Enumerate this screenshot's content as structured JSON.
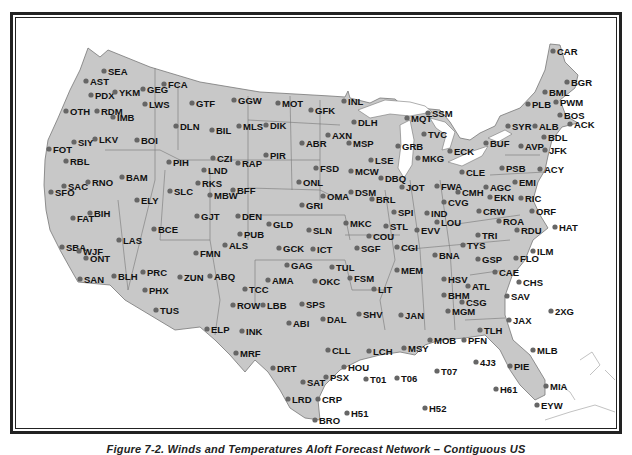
{
  "figure": {
    "caption": "Figure 7-2. Winds and Temperatures Aloft Forecast Network – Contiguous US",
    "land_color": "#c8c8c8",
    "water_color": "#ffffff",
    "dot_color": "#666666"
  },
  "stations": [
    {
      "id": "CAR",
      "x": 553,
      "y": 51
    },
    {
      "id": "BGR",
      "x": 567,
      "y": 82
    },
    {
      "id": "BML",
      "x": 545,
      "y": 92
    },
    {
      "id": "PLB",
      "x": 528,
      "y": 104
    },
    {
      "id": "PWM",
      "x": 556,
      "y": 102
    },
    {
      "id": "BOS",
      "x": 560,
      "y": 115
    },
    {
      "id": "ACK",
      "x": 570,
      "y": 124
    },
    {
      "id": "SYR",
      "x": 508,
      "y": 126
    },
    {
      "id": "ALB",
      "x": 535,
      "y": 126
    },
    {
      "id": "BDL",
      "x": 544,
      "y": 137
    },
    {
      "id": "JFK",
      "x": 545,
      "y": 150
    },
    {
      "id": "BUF",
      "x": 486,
      "y": 143
    },
    {
      "id": "AVP",
      "x": 521,
      "y": 146
    },
    {
      "id": "ACY",
      "x": 540,
      "y": 169
    },
    {
      "id": "PSB",
      "x": 502,
      "y": 168
    },
    {
      "id": "EMI",
      "x": 515,
      "y": 182
    },
    {
      "id": "SSM",
      "x": 428,
      "y": 113
    },
    {
      "id": "MQT",
      "x": 407,
      "y": 118
    },
    {
      "id": "TVC",
      "x": 424,
      "y": 134
    },
    {
      "id": "GRB",
      "x": 398,
      "y": 146
    },
    {
      "id": "MKG",
      "x": 418,
      "y": 158
    },
    {
      "id": "ECK",
      "x": 450,
      "y": 151
    },
    {
      "id": "CLE",
      "x": 462,
      "y": 172
    },
    {
      "id": "FWA",
      "x": 437,
      "y": 186
    },
    {
      "id": "CMH",
      "x": 458,
      "y": 192
    },
    {
      "id": "AGC",
      "x": 486,
      "y": 187
    },
    {
      "id": "EKN",
      "x": 490,
      "y": 197
    },
    {
      "id": "RIC",
      "x": 521,
      "y": 198
    },
    {
      "id": "ORF",
      "x": 532,
      "y": 211
    },
    {
      "id": "HAT",
      "x": 555,
      "y": 227
    },
    {
      "id": "CVG",
      "x": 444,
      "y": 202
    },
    {
      "id": "CRW",
      "x": 479,
      "y": 211
    },
    {
      "id": "ROA",
      "x": 499,
      "y": 221
    },
    {
      "id": "RDU",
      "x": 517,
      "y": 230
    },
    {
      "id": "TRI",
      "x": 478,
      "y": 235
    },
    {
      "id": "TYS",
      "x": 463,
      "y": 245
    },
    {
      "id": "ILM",
      "x": 533,
      "y": 251
    },
    {
      "id": "GSP",
      "x": 478,
      "y": 259
    },
    {
      "id": "FLO",
      "x": 516,
      "y": 258
    },
    {
      "id": "CAE",
      "x": 495,
      "y": 272
    },
    {
      "id": "CHS",
      "x": 519,
      "y": 282
    },
    {
      "id": "SAV",
      "x": 507,
      "y": 296
    },
    {
      "id": "2XG",
      "x": 551,
      "y": 311
    },
    {
      "id": "JAX",
      "x": 509,
      "y": 320
    },
    {
      "id": "TLH",
      "x": 480,
      "y": 330
    },
    {
      "id": "PFN",
      "x": 464,
      "y": 340
    },
    {
      "id": "MLB",
      "x": 533,
      "y": 350
    },
    {
      "id": "4J3",
      "x": 476,
      "y": 362
    },
    {
      "id": "PIE",
      "x": 510,
      "y": 366
    },
    {
      "id": "H61",
      "x": 496,
      "y": 389
    },
    {
      "id": "MIA",
      "x": 546,
      "y": 386
    },
    {
      "id": "EYW",
      "x": 537,
      "y": 405
    },
    {
      "id": "ATL",
      "x": 468,
      "y": 286
    },
    {
      "id": "HSV",
      "x": 444,
      "y": 279
    },
    {
      "id": "BHM",
      "x": 444,
      "y": 295
    },
    {
      "id": "CSG",
      "x": 462,
      "y": 302
    },
    {
      "id": "MGM",
      "x": 448,
      "y": 311
    },
    {
      "id": "MOB",
      "x": 430,
      "y": 340
    },
    {
      "id": "BNA",
      "x": 435,
      "y": 255
    },
    {
      "id": "MEM",
      "x": 397,
      "y": 270
    },
    {
      "id": "CGI",
      "x": 397,
      "y": 247
    },
    {
      "id": "EVV",
      "x": 417,
      "y": 230
    },
    {
      "id": "LOU",
      "x": 437,
      "y": 222
    },
    {
      "id": "IND",
      "x": 427,
      "y": 213
    },
    {
      "id": "STL",
      "x": 386,
      "y": 226
    },
    {
      "id": "SPI",
      "x": 394,
      "y": 212
    },
    {
      "id": "JOT",
      "x": 402,
      "y": 187
    },
    {
      "id": "BRL",
      "x": 372,
      "y": 199
    },
    {
      "id": "DBQ",
      "x": 381,
      "y": 178
    },
    {
      "id": "LSE",
      "x": 371,
      "y": 160
    },
    {
      "id": "MCW",
      "x": 351,
      "y": 171
    },
    {
      "id": "DSM",
      "x": 351,
      "y": 192
    },
    {
      "id": "OMA",
      "x": 323,
      "y": 196
    },
    {
      "id": "MKC",
      "x": 346,
      "y": 223
    },
    {
      "id": "COU",
      "x": 369,
      "y": 236
    },
    {
      "id": "SGF",
      "x": 357,
      "y": 248
    },
    {
      "id": "JAN",
      "x": 401,
      "y": 315
    },
    {
      "id": "MSY",
      "x": 404,
      "y": 348
    },
    {
      "id": "LIT",
      "x": 374,
      "y": 289
    },
    {
      "id": "FSM",
      "x": 350,
      "y": 278
    },
    {
      "id": "TUL",
      "x": 332,
      "y": 267
    },
    {
      "id": "OKC",
      "x": 315,
      "y": 281
    },
    {
      "id": "ICT",
      "x": 313,
      "y": 249
    },
    {
      "id": "SLN",
      "x": 309,
      "y": 230
    },
    {
      "id": "GCK",
      "x": 279,
      "y": 248
    },
    {
      "id": "GLD",
      "x": 269,
      "y": 224
    },
    {
      "id": "GAG",
      "x": 287,
      "y": 265
    },
    {
      "id": "AMA",
      "x": 268,
      "y": 280
    },
    {
      "id": "SPS",
      "x": 302,
      "y": 304
    },
    {
      "id": "DAL",
      "x": 323,
      "y": 319
    },
    {
      "id": "SHV",
      "x": 359,
      "y": 314
    },
    {
      "id": "LCH",
      "x": 369,
      "y": 351
    },
    {
      "id": "CLL",
      "x": 328,
      "y": 350
    },
    {
      "id": "HOU",
      "x": 344,
      "y": 367
    },
    {
      "id": "PSX",
      "x": 326,
      "y": 377
    },
    {
      "id": "SAT",
      "x": 303,
      "y": 382
    },
    {
      "id": "T01",
      "x": 366,
      "y": 379
    },
    {
      "id": "T06",
      "x": 397,
      "y": 378
    },
    {
      "id": "T07",
      "x": 437,
      "y": 371
    },
    {
      "id": "H52",
      "x": 425,
      "y": 408
    },
    {
      "id": "H51",
      "x": 347,
      "y": 413
    },
    {
      "id": "LRD",
      "x": 288,
      "y": 399
    },
    {
      "id": "CRP",
      "x": 318,
      "y": 399
    },
    {
      "id": "BRO",
      "x": 315,
      "y": 420
    },
    {
      "id": "DRT",
      "x": 273,
      "y": 368
    },
    {
      "id": "ABI",
      "x": 289,
      "y": 323
    },
    {
      "id": "LBB",
      "x": 263,
      "y": 305
    },
    {
      "id": "ROW",
      "x": 233,
      "y": 305
    },
    {
      "id": "INK",
      "x": 242,
      "y": 331
    },
    {
      "id": "MRF",
      "x": 236,
      "y": 353
    },
    {
      "id": "ELP",
      "x": 207,
      "y": 329
    },
    {
      "id": "TCC",
      "x": 245,
      "y": 289
    },
    {
      "id": "ABQ",
      "x": 210,
      "y": 276
    },
    {
      "id": "ZUN",
      "x": 180,
      "y": 277
    },
    {
      "id": "FMN",
      "x": 196,
      "y": 253
    },
    {
      "id": "ALS",
      "x": 225,
      "y": 245
    },
    {
      "id": "PUB",
      "x": 240,
      "y": 234
    },
    {
      "id": "DEN",
      "x": 238,
      "y": 216
    },
    {
      "id": "GJT",
      "x": 197,
      "y": 216
    },
    {
      "id": "BFF",
      "x": 233,
      "y": 190
    },
    {
      "id": "MBW",
      "x": 210,
      "y": 195
    },
    {
      "id": "RKS",
      "x": 198,
      "y": 183
    },
    {
      "id": "LND",
      "x": 204,
      "y": 170
    },
    {
      "id": "CZI",
      "x": 213,
      "y": 158
    },
    {
      "id": "RAP",
      "x": 238,
      "y": 163
    },
    {
      "id": "PIR",
      "x": 266,
      "y": 155
    },
    {
      "id": "ONL",
      "x": 299,
      "y": 182
    },
    {
      "id": "GRI",
      "x": 302,
      "y": 205
    },
    {
      "id": "FSD",
      "x": 316,
      "y": 168
    },
    {
      "id": "ABR",
      "x": 302,
      "y": 143
    },
    {
      "id": "AXN",
      "x": 328,
      "y": 135
    },
    {
      "id": "MSP",
      "x": 349,
      "y": 143
    },
    {
      "id": "DLH",
      "x": 354,
      "y": 122
    },
    {
      "id": "INL",
      "x": 344,
      "y": 101
    },
    {
      "id": "GFK",
      "x": 311,
      "y": 110
    },
    {
      "id": "MOT",
      "x": 278,
      "y": 103
    },
    {
      "id": "DIK",
      "x": 266,
      "y": 125
    },
    {
      "id": "MLS",
      "x": 239,
      "y": 126
    },
    {
      "id": "BIL",
      "x": 212,
      "y": 130
    },
    {
      "id": "GGW",
      "x": 234,
      "y": 100
    },
    {
      "id": "GTF",
      "x": 192,
      "y": 103
    },
    {
      "id": "DLN",
      "x": 176,
      "y": 126
    },
    {
      "id": "FCA",
      "x": 164,
      "y": 84
    },
    {
      "id": "GEG",
      "x": 143,
      "y": 89
    },
    {
      "id": "LWS",
      "x": 145,
      "y": 104
    },
    {
      "id": "SEA",
      "x": 104,
      "y": 71
    },
    {
      "id": "AST",
      "x": 86,
      "y": 81
    },
    {
      "id": "PDX",
      "x": 91,
      "y": 95
    },
    {
      "id": "YKM",
      "x": 115,
      "y": 92
    },
    {
      "id": "RDM",
      "x": 97,
      "y": 111
    },
    {
      "id": "IMB",
      "x": 113,
      "y": 117
    },
    {
      "id": "OTH",
      "x": 66,
      "y": 111
    },
    {
      "id": "LKV",
      "x": 95,
      "y": 139
    },
    {
      "id": "BOI",
      "x": 137,
      "y": 140
    },
    {
      "id": "FOT",
      "x": 49,
      "y": 149
    },
    {
      "id": "SIY",
      "x": 74,
      "y": 142
    },
    {
      "id": "RBL",
      "x": 66,
      "y": 161
    },
    {
      "id": "SAC",
      "x": 64,
      "y": 186
    },
    {
      "id": "RNO",
      "x": 88,
      "y": 182
    },
    {
      "id": "SFO",
      "x": 51,
      "y": 192
    },
    {
      "id": "BAM",
      "x": 122,
      "y": 177
    },
    {
      "id": "PIH",
      "x": 169,
      "y": 162
    },
    {
      "id": "SLC",
      "x": 170,
      "y": 191
    },
    {
      "id": "ELY",
      "x": 137,
      "y": 200
    },
    {
      "id": "BIH",
      "x": 90,
      "y": 213
    },
    {
      "id": "FAT",
      "x": 73,
      "y": 218
    },
    {
      "id": "BCE",
      "x": 154,
      "y": 229
    },
    {
      "id": "LAS",
      "x": 119,
      "y": 240
    },
    {
      "id": "SBA",
      "x": 62,
      "y": 247
    },
    {
      "id": "WJF",
      "x": 79,
      "y": 251
    },
    {
      "id": "ONT",
      "x": 86,
      "y": 258
    },
    {
      "id": "SAN",
      "x": 80,
      "y": 279
    },
    {
      "id": "BLH",
      "x": 114,
      "y": 276
    },
    {
      "id": "PRC",
      "x": 143,
      "y": 272
    },
    {
      "id": "PHX",
      "x": 145,
      "y": 290
    },
    {
      "id": "TUS",
      "x": 156,
      "y": 310
    }
  ]
}
